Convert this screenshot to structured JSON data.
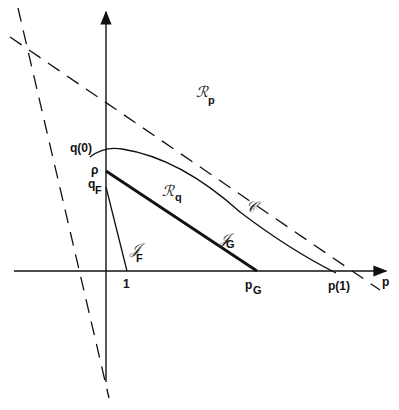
{
  "axes": {
    "x_label": "p",
    "origin": {
      "x": 106,
      "y": 271
    }
  },
  "labels": {
    "q0": "q(0)",
    "rho": "ρ",
    "qF": {
      "main": "q",
      "sub": "F"
    },
    "one": "1",
    "pG": {
      "main": "p",
      "sub": "G"
    },
    "p1": "p(1)",
    "Rp": {
      "main": "ℛ",
      "sub": "p"
    },
    "Rq": {
      "main": "ℛ",
      "sub": "q"
    },
    "JF": {
      "main": "𝒥",
      "sub": "F"
    },
    "JG": {
      "main": "𝒥",
      "sub": "G"
    },
    "C": "𝒞"
  },
  "colors": {
    "ink": "#111111",
    "background": "#ffffff"
  }
}
